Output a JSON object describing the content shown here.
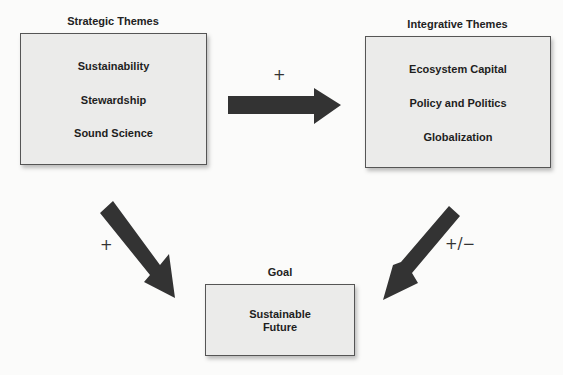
{
  "strategic": {
    "title": "Strategic Themes",
    "items": [
      "Sustainability",
      "Stewardship",
      "Sound Science"
    ]
  },
  "integrative": {
    "title": "Integrative Themes",
    "items": [
      "Ecosystem Capital",
      "Policy and Politics",
      "Globalization"
    ]
  },
  "goal": {
    "title": "Goal",
    "line1": "Sustainable",
    "line2": "Future"
  },
  "arrows": {
    "strategic_to_integrative": "+",
    "strategic_to_goal": "+",
    "integrative_to_goal": "+/−"
  },
  "colors": {
    "arrow": "#333333",
    "box": "#ebebea"
  }
}
